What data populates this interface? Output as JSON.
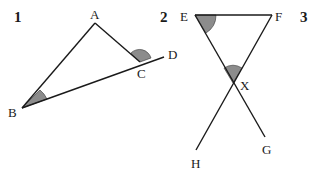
{
  "figures": [
    {
      "number": "1",
      "labels": {
        "A": "A",
        "B": "B",
        "C": "C",
        "D": "D"
      },
      "description": "Triangle ABC with side BC extended to D; shaded angle at B and shaded exterior angle ACD"
    },
    {
      "number": "2",
      "labels": {
        "E": "E",
        "F": "F",
        "X": "X",
        "G": "G",
        "H": "H"
      },
      "description": "Lines EG and FH intersect at X; EF horizontal segment; shaded angle FEX and shaded angle EXF"
    },
    {
      "number": "3"
    }
  ],
  "colors": {
    "line": "#1a1a1a",
    "shade": "#8c8c8c",
    "background": "#ffffff"
  }
}
